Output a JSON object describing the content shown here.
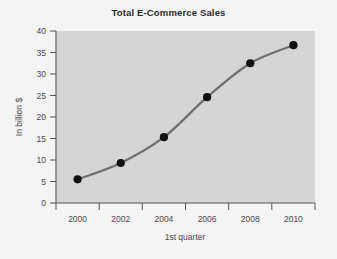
{
  "chart_data": {
    "type": "line",
    "title": "Total E-Commerce Sales",
    "xlabel": "1st quarter",
    "ylabel": "In billion $",
    "categories": [
      "2000",
      "2002",
      "2004",
      "2006",
      "2008",
      "2010"
    ],
    "x": [
      2000,
      2002,
      2004,
      2006,
      2008,
      2010
    ],
    "values": [
      5.5,
      9.3,
      15.3,
      24.6,
      32.5,
      36.7
    ],
    "series": [
      {
        "name": "Total E-Commerce Sales",
        "values": [
          5.5,
          9.3,
          15.3,
          24.6,
          32.5,
          36.7
        ]
      }
    ],
    "ylim": [
      0,
      40
    ],
    "yticks": [
      0,
      5,
      10,
      15,
      20,
      25,
      30,
      35,
      40
    ],
    "ytick_labels": [
      "0",
      "5",
      "10",
      "15",
      "20",
      "25",
      "30",
      "35",
      "40"
    ],
    "xlim": [
      1999,
      2011
    ],
    "xticks": [
      2000,
      2002,
      2004,
      2006,
      2008,
      2010
    ],
    "xtick_labels": [
      "2000",
      "2002",
      "2004",
      "2006",
      "2008",
      "2010"
    ],
    "grid": false,
    "legend": false,
    "legend_position": "none",
    "marker": "circle",
    "colors": {
      "line": "#6f6f6f",
      "marker": "#111111",
      "plot_background": "#d5d5d5",
      "figure_background": "#f4f4f4",
      "axis": "#555555",
      "text": "#4a4a4a",
      "title_text": "#2b2b2b"
    }
  }
}
